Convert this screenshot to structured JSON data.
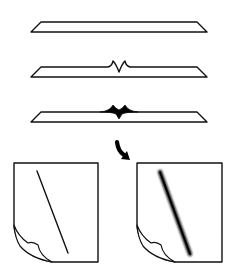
{
  "diagram": {
    "title": "",
    "colors": {
      "stroke": "#111111",
      "background": "#ffffff",
      "fill": "#000000"
    },
    "stages": [
      {
        "id": "plate-flat",
        "label": ""
      },
      {
        "id": "plate-open-notch",
        "label": ""
      },
      {
        "id": "plate-filled-notch",
        "label": ""
      }
    ],
    "arrow": {
      "icon": "curved-arrow-down-right-icon",
      "label": ""
    },
    "sheets": [
      {
        "id": "sheet-before",
        "line_style": "thin",
        "label": ""
      },
      {
        "id": "sheet-after",
        "line_style": "thick-blurred",
        "label": ""
      }
    ]
  }
}
